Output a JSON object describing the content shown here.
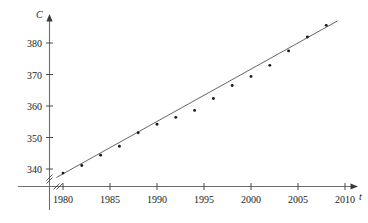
{
  "chart_data": {
    "type": "scatter",
    "title": "",
    "xlabel": "t",
    "ylabel": "C",
    "xlim": [
      1977,
      2012
    ],
    "ylim": [
      335,
      389
    ],
    "grid": false,
    "legend": "none",
    "axis_break_x": true,
    "axis_break_y": true,
    "xticks": [
      1980,
      1985,
      1990,
      1995,
      2000,
      2005,
      2010
    ],
    "xtick_labels": [
      "1980",
      "1985",
      "1990",
      "1995",
      "2000",
      "2005",
      "2010"
    ],
    "yticks": [
      340,
      350,
      360,
      370,
      380
    ],
    "ytick_labels": [
      "340",
      "350",
      "360",
      "370",
      "380"
    ],
    "series": [
      {
        "name": "CO2 concentration",
        "marker": "dot",
        "color": "#1a1a1a",
        "x": [
          1980,
          1982,
          1984,
          1986,
          1988,
          1990,
          1992,
          1994,
          1996,
          1998,
          2000,
          2002,
          2004,
          2006,
          2008
        ],
        "y": [
          338.7,
          341.1,
          344.4,
          347.2,
          351.5,
          354.2,
          356.4,
          358.6,
          362.4,
          366.5,
          369.4,
          372.9,
          377.5,
          381.9,
          385.6
        ]
      }
    ],
    "fit_line": {
      "name": "regression line",
      "color": "#555555",
      "x_start": 1979.3,
      "y_start": 337.3,
      "x_end": 2009.2,
      "y_end": 387.0
    }
  },
  "axis_labels": {
    "y_axis_name": "C",
    "x_axis_name": "t"
  }
}
